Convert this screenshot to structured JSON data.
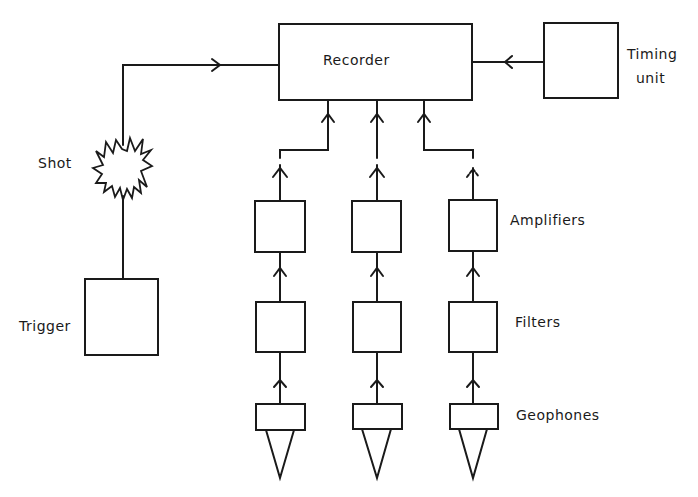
{
  "diagram": {
    "type": "block-diagram",
    "stroke_color": "#1a1a1a",
    "background": "#ffffff",
    "labels": {
      "recorder": "Recorder",
      "timing_unit_line1": "Timing",
      "timing_unit_line2": "unit",
      "shot": "Shot",
      "trigger": "Trigger",
      "amplifiers": "Amplifiers",
      "filters": "Filters",
      "geophones": "Geophones"
    },
    "nodes": [
      {
        "id": "recorder",
        "label": "Recorder"
      },
      {
        "id": "timing-unit",
        "label": "Timing unit"
      },
      {
        "id": "shot",
        "label": "Shot",
        "shape": "starburst"
      },
      {
        "id": "trigger",
        "label": "Trigger"
      },
      {
        "id": "amplifier-1",
        "group": "Amplifiers"
      },
      {
        "id": "amplifier-2",
        "group": "Amplifiers"
      },
      {
        "id": "amplifier-3",
        "group": "Amplifiers"
      },
      {
        "id": "filter-1",
        "group": "Filters"
      },
      {
        "id": "filter-2",
        "group": "Filters"
      },
      {
        "id": "filter-3",
        "group": "Filters"
      },
      {
        "id": "geophone-1",
        "group": "Geophones"
      },
      {
        "id": "geophone-2",
        "group": "Geophones"
      },
      {
        "id": "geophone-3",
        "group": "Geophones"
      }
    ],
    "edges": [
      {
        "from": "trigger",
        "to": "shot"
      },
      {
        "from": "shot",
        "to": "recorder",
        "arrow": true
      },
      {
        "from": "timing-unit",
        "to": "recorder",
        "arrow": true
      },
      {
        "from": "geophone-1",
        "to": "filter-1",
        "arrow": true
      },
      {
        "from": "geophone-2",
        "to": "filter-2",
        "arrow": true
      },
      {
        "from": "geophone-3",
        "to": "filter-3",
        "arrow": true
      },
      {
        "from": "filter-1",
        "to": "amplifier-1",
        "arrow": true
      },
      {
        "from": "filter-2",
        "to": "amplifier-2",
        "arrow": true
      },
      {
        "from": "filter-3",
        "to": "amplifier-3",
        "arrow": true
      },
      {
        "from": "amplifier-1",
        "to": "recorder",
        "arrow": true
      },
      {
        "from": "amplifier-2",
        "to": "recorder",
        "arrow": true
      },
      {
        "from": "amplifier-3",
        "to": "recorder",
        "arrow": true
      }
    ]
  }
}
